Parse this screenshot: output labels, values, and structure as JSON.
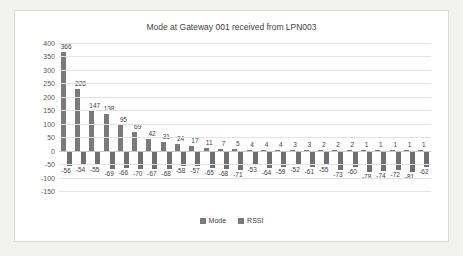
{
  "chart_data": {
    "type": "bar",
    "title": "Mode at Gateway 001 received from LPN003",
    "xlabel": "",
    "ylabel": "",
    "ylim": [
      -150,
      400
    ],
    "yticks": [
      400,
      350,
      300,
      250,
      200,
      150,
      100,
      50,
      0,
      -50,
      -100,
      -150
    ],
    "grid": true,
    "legend_position": "bottom",
    "categories": [
      "1",
      "2",
      "3",
      "4",
      "5",
      "6",
      "7",
      "8",
      "9",
      "10",
      "11",
      "12",
      "13",
      "14",
      "15",
      "16",
      "17",
      "18",
      "19",
      "20",
      "21",
      "22",
      "23",
      "24",
      "25",
      "26"
    ],
    "series": [
      {
        "name": "Mode",
        "color": "#7a7a7a",
        "values": [
          366,
          228,
          147,
          138,
          95,
          69,
          42,
          31,
          24,
          17,
          11,
          7,
          5,
          4,
          4,
          4,
          3,
          3,
          2,
          2,
          2,
          1,
          1,
          1,
          1,
          1
        ]
      },
      {
        "name": "RSSI",
        "color": "#6f6f6f",
        "values": [
          -56,
          -54,
          -55,
          -69,
          -66,
          -70,
          -67,
          -68,
          -58,
          -57,
          -65,
          -68,
          -71,
          -53,
          -64,
          -59,
          -52,
          -61,
          -55,
          -73,
          -60,
          -78,
          -74,
          -72,
          -81,
          -62
        ]
      }
    ]
  },
  "legend": {
    "items": [
      {
        "label": "Mode"
      },
      {
        "label": "RSSI"
      }
    ]
  }
}
